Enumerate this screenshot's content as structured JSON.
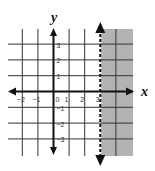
{
  "chart_data": {
    "type": "inequality-graph",
    "title": "",
    "xlabel": "x",
    "ylabel": "y",
    "xlim": [
      -3,
      4
    ],
    "ylim": [
      -4,
      4
    ],
    "grid": true,
    "x_ticks": [
      -2,
      -1,
      0,
      1,
      2,
      3
    ],
    "x_tick_labels": [
      "−2",
      "−1",
      "0",
      "1",
      "2",
      "3"
    ],
    "y_ticks": [
      3,
      2,
      1,
      -1,
      -2,
      -3
    ],
    "y_tick_labels": [
      "3",
      "2",
      "1",
      "−1",
      "−2",
      "−3"
    ],
    "boundary": {
      "type": "vertical",
      "x": 3,
      "style": "dashed",
      "equation": "x = 3"
    },
    "shaded_region": {
      "side": "right",
      "inequality": "x > 3",
      "color": "#b3b3b3"
    },
    "colors": {
      "grid": "#333333",
      "axis": "#111111",
      "shade": "#b3b3b3"
    }
  }
}
